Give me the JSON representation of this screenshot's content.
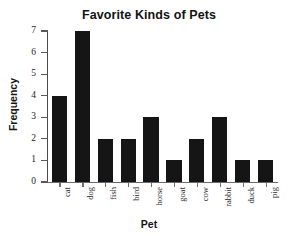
{
  "chart_data": {
    "type": "bar",
    "title": "Favorite Kinds of Pets",
    "xlabel": "Pet",
    "ylabel": "Frequency",
    "categories": [
      "cat",
      "dog",
      "fish",
      "bird",
      "horse",
      "goat",
      "cow",
      "rabbit",
      "duck",
      "pig"
    ],
    "values": [
      4,
      7,
      2,
      2,
      3,
      1,
      2,
      3,
      1,
      1
    ],
    "ylim": [
      0,
      7
    ],
    "yticks": [
      0,
      1,
      2,
      3,
      4,
      5,
      6,
      7
    ],
    "ytick_labels": [
      "0",
      "1",
      "2",
      "3",
      "4",
      "5",
      "6",
      "7"
    ],
    "grid": false,
    "legend": null,
    "bar_color": "#151515",
    "axis_color": "#5a5a5a",
    "background_color": "#ffffff"
  }
}
